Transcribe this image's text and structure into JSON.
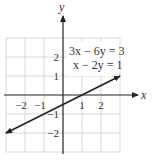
{
  "chart_data": {
    "type": "line",
    "title": "",
    "xlabel": "x",
    "ylabel": "y",
    "xlim": [
      -3,
      3
    ],
    "ylim": [
      -3,
      3
    ],
    "grid": true,
    "x_ticks": [
      -2,
      -1,
      1,
      2
    ],
    "y_ticks": [
      2,
      1,
      -1,
      -2
    ],
    "x_tick_labels": [
      "−2",
      "−1",
      "1",
      "2"
    ],
    "y_tick_labels": [
      "2",
      "1",
      "−1",
      "−2"
    ],
    "annotations": [
      "3x − 6y = 3",
      "x − 2y = 1"
    ],
    "series": [
      {
        "name": "x − 2y = 1",
        "x": [
          -3,
          3
        ],
        "y": [
          -2,
          1
        ],
        "arrows_both_ends": true
      }
    ]
  }
}
